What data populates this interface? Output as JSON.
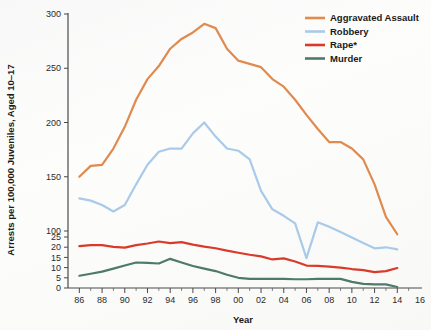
{
  "chart_data": {
    "type": "line",
    "title": "",
    "xlabel": "Year",
    "ylabel": "Arrests per 100,000 Juveniles, Aged 10–17",
    "grid": false,
    "legend_position": "top-right",
    "axis_note": "y-axis uses a broken scale: 0,5,10,15,20,25 then 100,150,200,250,300",
    "x_tick_labels": [
      "86",
      "88",
      "90",
      "92",
      "94",
      "96",
      "98",
      "00",
      "02",
      "04",
      "06",
      "08",
      "10",
      "12",
      "14",
      "16"
    ],
    "x_tick_values": [
      1986,
      1988,
      1990,
      1992,
      1994,
      1996,
      1998,
      2000,
      2002,
      2004,
      2006,
      2008,
      2010,
      2012,
      2014,
      2016
    ],
    "xlim": [
      1985,
      2016
    ],
    "y_tick_labels": [
      "0",
      "5",
      "10",
      "15",
      "20",
      "25",
      "100",
      "150",
      "200",
      "250",
      "300"
    ],
    "y_tick_values": [
      0,
      5,
      10,
      15,
      20,
      25,
      100,
      150,
      200,
      250,
      300
    ],
    "ylim": [
      0,
      300
    ],
    "x": [
      1986,
      1987,
      1988,
      1989,
      1990,
      1991,
      1992,
      1993,
      1994,
      1995,
      1996,
      1997,
      1998,
      1999,
      2000,
      2001,
      2002,
      2003,
      2004,
      2005,
      2006,
      2007,
      2008,
      2009,
      2010,
      2011,
      2012,
      2013,
      2014
    ],
    "series": [
      {
        "name": "Aggravated Assault",
        "color": "#e08a4e",
        "values": [
          150,
          160,
          161,
          176,
          196,
          221,
          240,
          252,
          268,
          277,
          283,
          291,
          287,
          268,
          257,
          254,
          251,
          240,
          233,
          221,
          207,
          194,
          182,
          182,
          176,
          166,
          143,
          113,
          97
        ]
      },
      {
        "name": "Robbery",
        "color": "#a9cae8",
        "values": [
          130,
          128,
          124,
          118,
          124,
          143,
          161,
          173,
          176,
          176,
          190,
          200,
          187,
          176,
          174,
          166,
          137,
          120,
          114,
          107,
          75,
          108,
          104,
          99,
          94,
          89,
          84,
          85,
          83
        ]
      },
      {
        "name": "Rape*",
        "color": "#d93a2b",
        "values": [
          20.5,
          21.0,
          21.0,
          20.2,
          19.8,
          21.0,
          21.8,
          22.8,
          22.0,
          22.5,
          21.3,
          20.3,
          19.5,
          18.3,
          17.3,
          16.3,
          15.5,
          14.0,
          14.5,
          13.0,
          11.0,
          10.8,
          10.5,
          10.0,
          9.3,
          8.8,
          7.8,
          8.3,
          9.8
        ]
      },
      {
        "name": "Murder",
        "color": "#4e7a6b",
        "values": [
          6.0,
          7.0,
          8.0,
          9.5,
          11.0,
          12.5,
          12.3,
          12.0,
          14.3,
          12.5,
          10.8,
          9.5,
          8.3,
          6.5,
          5.0,
          4.5,
          4.5,
          4.5,
          4.5,
          4.3,
          4.3,
          4.5,
          4.5,
          4.5,
          3.0,
          2.0,
          1.8,
          1.8,
          0.5
        ]
      }
    ]
  },
  "legend": {
    "items": [
      {
        "label": "Aggravated Assault",
        "color": "#e08a4e"
      },
      {
        "label": "Robbery",
        "color": "#a9cae8"
      },
      {
        "label": "Rape*",
        "color": "#d93a2b"
      },
      {
        "label": "Murder",
        "color": "#4e7a6b"
      }
    ]
  }
}
